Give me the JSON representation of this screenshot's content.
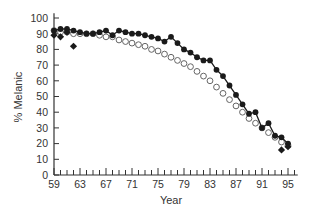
{
  "chart_data": {
    "type": "line",
    "title": "",
    "xlabel": "Year",
    "ylabel": "% Melanic",
    "xlim": [
      59,
      96
    ],
    "ylim": [
      0,
      100
    ],
    "x_ticks": [
      "59",
      "63",
      "67",
      "71",
      "75",
      "79",
      "83",
      "87",
      "91",
      "95"
    ],
    "y_ticks": [
      "0",
      "10",
      "20",
      "30",
      "40",
      "50",
      "60",
      "70",
      "80",
      "90",
      "100"
    ],
    "grid": false,
    "legend": null,
    "series": [
      {
        "name": "Observed (filled circles)",
        "marker": "filled-circle",
        "line": true,
        "x": [
          59,
          60,
          61,
          62,
          63,
          64,
          65,
          66,
          67,
          68,
          69,
          70,
          71,
          72,
          73,
          74,
          75,
          76,
          77,
          78,
          79,
          80,
          81,
          82,
          83,
          84,
          85,
          86,
          87,
          88,
          89,
          90,
          91,
          92,
          93,
          94,
          95
        ],
        "values": [
          92,
          93,
          93,
          92,
          91,
          90,
          90,
          91,
          92,
          89,
          92,
          91,
          90,
          90,
          89,
          88,
          87,
          85,
          88,
          84,
          80,
          78,
          75,
          73,
          73,
          67,
          63,
          57,
          51,
          45,
          39,
          40,
          30,
          33,
          25,
          24,
          20
        ]
      },
      {
        "name": "Predicted (open circles)",
        "marker": "open-circle",
        "line": false,
        "x": [
          59,
          60,
          61,
          62,
          63,
          64,
          65,
          66,
          67,
          68,
          69,
          70,
          71,
          72,
          73,
          74,
          75,
          76,
          77,
          78,
          79,
          80,
          81,
          82,
          83,
          84,
          85,
          86,
          87,
          88,
          89,
          90,
          91,
          92,
          93,
          94,
          95
        ],
        "values": [
          92,
          91,
          91,
          90,
          90,
          90,
          90,
          89,
          88,
          88,
          86,
          85,
          84,
          83,
          82,
          80,
          79,
          77,
          75,
          73,
          71,
          69,
          66,
          63,
          60,
          56,
          52,
          48,
          44,
          40,
          36,
          33,
          30,
          27,
          24,
          21,
          19
        ]
      },
      {
        "name": "Other samples (filled diamonds)",
        "marker": "filled-diamond",
        "line": false,
        "x": [
          59,
          60,
          61,
          62,
          94,
          95
        ],
        "values": [
          89,
          88,
          91,
          82,
          16,
          18
        ]
      }
    ]
  },
  "axes": {
    "xlabel": "Year",
    "ylabel": "% Melanic"
  },
  "colors": {
    "axis": "#333333",
    "filled": "#1a1a1a",
    "open_stroke": "#555555"
  }
}
